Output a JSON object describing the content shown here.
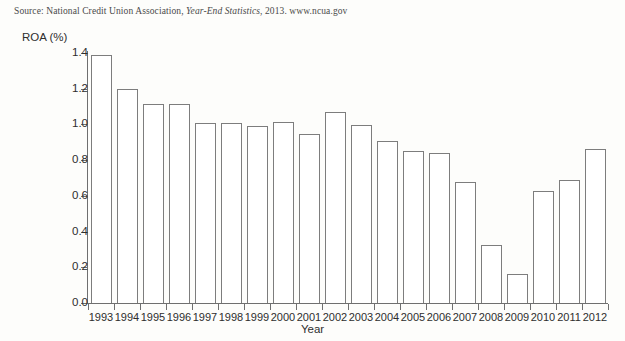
{
  "source": {
    "prefix": "Source: National Credit Union Association, ",
    "italic": "Year-End Statistics",
    "suffix": ", 2013. www.ncua.gov"
  },
  "chart_data": {
    "type": "bar",
    "title": "",
    "xlabel": "Year",
    "ylabel": "ROA (%)",
    "categories": [
      "1993",
      "1994",
      "1995",
      "1996",
      "1997",
      "1998",
      "1999",
      "2000",
      "2001",
      "2002",
      "2003",
      "2004",
      "2005",
      "2006",
      "2007",
      "2008",
      "2009",
      "2010",
      "2011",
      "2012"
    ],
    "values": [
      1.39,
      1.2,
      1.115,
      1.115,
      1.01,
      1.01,
      0.99,
      1.015,
      0.945,
      1.07,
      0.995,
      0.905,
      0.85,
      0.84,
      0.675,
      0.325,
      0.16,
      0.63,
      0.69,
      0.86
    ],
    "ylim": [
      0.0,
      1.4
    ],
    "yticks": [
      "0.0",
      "0.2",
      "0.4",
      "0.6",
      "0.8",
      "1.0",
      "1.2",
      "1.4"
    ],
    "ytick_values": [
      0.0,
      0.2,
      0.4,
      0.6,
      0.8,
      1.0,
      1.2,
      1.4
    ],
    "grid": false,
    "legend": null,
    "bar_fill": "#ffffff",
    "bar_outline": "#7d7d7d",
    "axis_color": "#6f6f6f"
  }
}
